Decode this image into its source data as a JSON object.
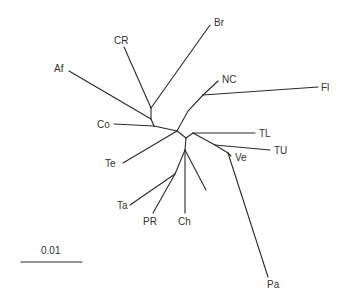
{
  "diagram": {
    "type": "unrooted phylogenetic tree",
    "taxa": [
      {
        "id": "Br",
        "label": "Br"
      },
      {
        "id": "CR",
        "label": "CR"
      },
      {
        "id": "Af",
        "label": "Af"
      },
      {
        "id": "Co",
        "label": "Co"
      },
      {
        "id": "NC",
        "label": "NC"
      },
      {
        "id": "Fl",
        "label": "Fl"
      },
      {
        "id": "TL",
        "label": "TL"
      },
      {
        "id": "TU",
        "label": "TU"
      },
      {
        "id": "Ve",
        "label": "Ve"
      },
      {
        "id": "Pa",
        "label": "Pa"
      },
      {
        "id": "Te",
        "label": "Te"
      },
      {
        "id": "Ta",
        "label": "Ta"
      },
      {
        "id": "PR",
        "label": "PR"
      },
      {
        "id": "Ch",
        "label": "Ch"
      }
    ],
    "scale_bar": {
      "label": "0.01"
    }
  }
}
